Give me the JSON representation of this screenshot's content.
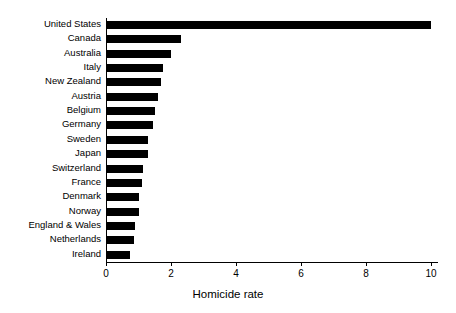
{
  "chart_data": {
    "type": "bar",
    "orientation": "horizontal",
    "title": "",
    "xlabel": "Homicide rate",
    "ylabel": "",
    "xlim": [
      0,
      10.2
    ],
    "xticks": [
      0,
      2,
      4,
      6,
      8,
      10
    ],
    "xtick_labels": [
      "0",
      "2",
      "4",
      "6",
      "8",
      "10"
    ],
    "grid": false,
    "legend": null,
    "bar_color": "#000000",
    "background_color": "#ffffff",
    "categories": [
      "United States",
      "Canada",
      "Australia",
      "Italy",
      "New Zealand",
      "Austria",
      "Belgium",
      "Germany",
      "Sweden",
      "Japan",
      "Switzerland",
      "France",
      "Denmark",
      "Norway",
      "England & Wales",
      "Netherlands",
      "Ireland"
    ],
    "values": [
      10.0,
      2.3,
      2.0,
      1.75,
      1.7,
      1.6,
      1.5,
      1.45,
      1.3,
      1.3,
      1.15,
      1.1,
      1.0,
      1.0,
      0.9,
      0.85,
      0.75
    ]
  }
}
